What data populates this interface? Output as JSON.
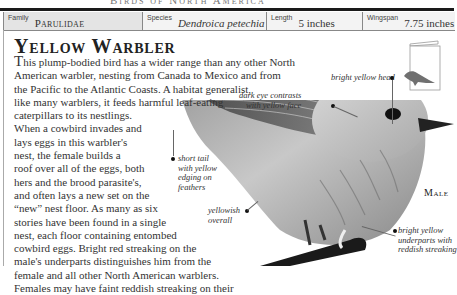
{
  "running_head": "Birds of North America",
  "infobar": {
    "family": {
      "label": "Family",
      "value": "Parulidae"
    },
    "species": {
      "label": "Species",
      "value": "Dendroica petechia"
    },
    "length": {
      "label": "Length",
      "value": "5 inches"
    },
    "wingspan": {
      "label": "Wingspan",
      "value": "7.75 inches"
    }
  },
  "title": "Yellow Warbler",
  "body_lines": [
    "his plump-bodied bird has a wider range than any other North",
    "American warbler, nesting from Canada to Mexico and from",
    "the Pacific to the Atlantic Coasts. A habitat generalist,",
    "like many warblers, it feeds harmful leaf-eating",
    "caterpillars to its nestlings.",
    "When a cowbird invades and",
    "lays eggs in this warbler's",
    "nest, the female builds a",
    "roof over all of the eggs, both",
    "hers and the brood parasite's,",
    "and often lays a new set on the",
    "“new” nest floor. As many as six",
    "stories have been found in a single",
    "nest, each floor containing entombed",
    "cowbird eggs. Bright red streaking on the",
    "male's underparts distinguishes him from the",
    "female and all other North American warblers.",
    "Females may have faint reddish streaking on their"
  ],
  "drop_cap": "T",
  "annotations": {
    "head": [
      "bright yellow head"
    ],
    "eye": [
      "dark eye contrasts",
      "with yellow face"
    ],
    "tail": [
      "short tail",
      "with yellow",
      "edging on",
      "feathers"
    ],
    "overall": [
      "yellowish",
      "overall"
    ],
    "underparts": [
      "bright yellow",
      "underparts with",
      "reddish streaking"
    ]
  },
  "sex_label": "Male",
  "colors": {
    "rule": "#1a1a1a",
    "family_cell_bg": "#e4e4e4",
    "cell_bg": "#f3f3f3",
    "thumb_bird": "#707070"
  }
}
